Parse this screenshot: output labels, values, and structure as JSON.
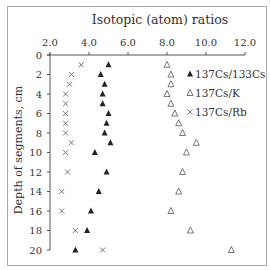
{
  "chart_data": {
    "type": "scatter",
    "title": "Isotopic  (atom) ratios",
    "xlabel": "Isotopic (atom) ratios",
    "ylabel": "Depth of segments, cm",
    "xlim": [
      2.0,
      12.0
    ],
    "ylim": [
      0,
      20
    ],
    "y_inverted": true,
    "x_ticks": [
      "2.0",
      "4.0",
      "6.0",
      "8.0",
      "10.0",
      "12.0"
    ],
    "y_ticks": [
      "0",
      "2",
      "4",
      "6",
      "8",
      "10",
      "12",
      "14",
      "16",
      "18",
      "20"
    ],
    "x_axis_position": "top",
    "grid": false,
    "legend_position": "upper right inside",
    "series": [
      {
        "name": "137Cs/133Cs",
        "marker": "filled-triangle",
        "points": [
          [
            5.0,
            1
          ],
          [
            4.6,
            2
          ],
          [
            4.8,
            3
          ],
          [
            4.7,
            4
          ],
          [
            4.7,
            5
          ],
          [
            5.0,
            6
          ],
          [
            4.9,
            7
          ],
          [
            4.8,
            8
          ],
          [
            5.1,
            9
          ],
          [
            4.3,
            10
          ],
          [
            4.9,
            12
          ],
          [
            4.5,
            14
          ],
          [
            4.1,
            16
          ],
          [
            3.9,
            18
          ],
          [
            3.3,
            20
          ]
        ]
      },
      {
        "name": "137Cs/K",
        "marker": "open-triangle",
        "points": [
          [
            8.0,
            1
          ],
          [
            8.2,
            2
          ],
          [
            8.2,
            3
          ],
          [
            8.0,
            4
          ],
          [
            8.2,
            5
          ],
          [
            8.4,
            6
          ],
          [
            8.6,
            7
          ],
          [
            8.8,
            8
          ],
          [
            9.5,
            9
          ],
          [
            9.0,
            10
          ],
          [
            8.8,
            12
          ],
          [
            8.6,
            14
          ],
          [
            8.2,
            16
          ],
          [
            9.2,
            18
          ],
          [
            11.3,
            20
          ]
        ]
      },
      {
        "name": "137Cs/Rb",
        "marker": "x",
        "points": [
          [
            3.6,
            1
          ],
          [
            3.1,
            2
          ],
          [
            3.0,
            3
          ],
          [
            2.8,
            4
          ],
          [
            2.8,
            5
          ],
          [
            2.8,
            6
          ],
          [
            2.8,
            7
          ],
          [
            2.8,
            8
          ],
          [
            3.1,
            9
          ],
          [
            2.8,
            10
          ],
          [
            2.9,
            12
          ],
          [
            2.6,
            14
          ],
          [
            2.6,
            16
          ],
          [
            3.3,
            18
          ],
          [
            4.7,
            20
          ]
        ]
      }
    ]
  },
  "legend": {
    "items": [
      {
        "symbol": "▲",
        "label": "137Cs/133Cs"
      },
      {
        "symbol": "△",
        "label": "137Cs/K"
      },
      {
        "symbol": "×",
        "label": "137Cs/Rb"
      }
    ]
  }
}
